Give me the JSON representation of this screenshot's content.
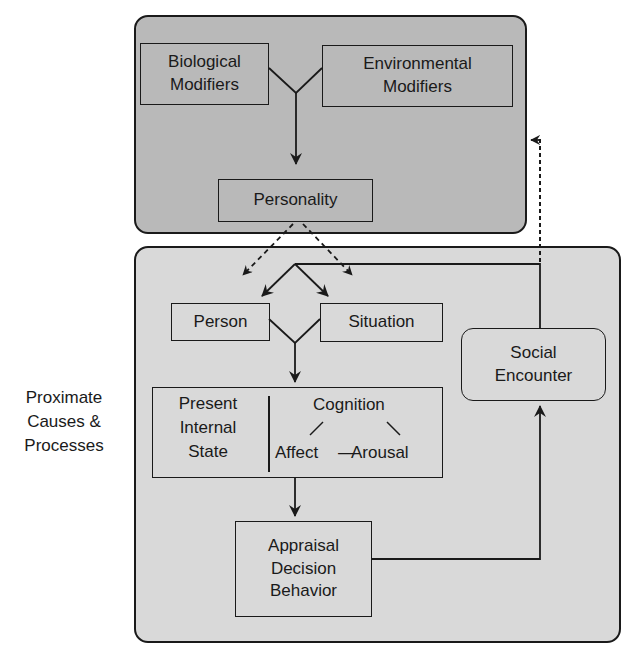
{
  "diagram": {
    "colors": {
      "outer_top_fill": "#b9b9b9",
      "outer_bottom_fill": "#d9d9d9",
      "line": "#1a1a1a"
    },
    "panels": {
      "top": {
        "name": "distal-causes-panel"
      },
      "bottom": {
        "name": "proximate-causes-panel",
        "side_label": "Proximate\nCauses &\nProcesses"
      }
    },
    "nodes": {
      "biological": "Biological\nModifiers",
      "environmental": "Environmental\nModifiers",
      "personality": "Personality",
      "person": "Person",
      "situation": "Situation",
      "social_encounter": "Social\nEncounter",
      "present_internal_state": {
        "title": "Present\nInternal\nState",
        "cognition": "Cognition",
        "affect": "Affect",
        "connector": "—",
        "arousal": "Arousal"
      },
      "appraisal": "Appraisal\nDecision\nBehavior"
    },
    "edges": [
      {
        "from": "Biological Modifiers",
        "to": "Personality",
        "style": "solid"
      },
      {
        "from": "Environmental Modifiers",
        "to": "Personality",
        "style": "solid"
      },
      {
        "from": "Personality",
        "to": "Person",
        "style": "dashed"
      },
      {
        "from": "Personality",
        "to": "Situation",
        "style": "dashed"
      },
      {
        "from": "Social Encounter",
        "to": "Person",
        "style": "solid"
      },
      {
        "from": "Social Encounter",
        "to": "Situation",
        "style": "solid"
      },
      {
        "from": "Social Encounter",
        "to": "Distal causes panel",
        "style": "dashed"
      },
      {
        "from": "Person",
        "to": "Present Internal State",
        "style": "solid"
      },
      {
        "from": "Situation",
        "to": "Present Internal State",
        "style": "solid"
      },
      {
        "from": "Present Internal State",
        "to": "Appraisal Decision Behavior",
        "style": "solid"
      },
      {
        "from": "Appraisal Decision Behavior",
        "to": "Social Encounter",
        "style": "solid"
      }
    ]
  }
}
